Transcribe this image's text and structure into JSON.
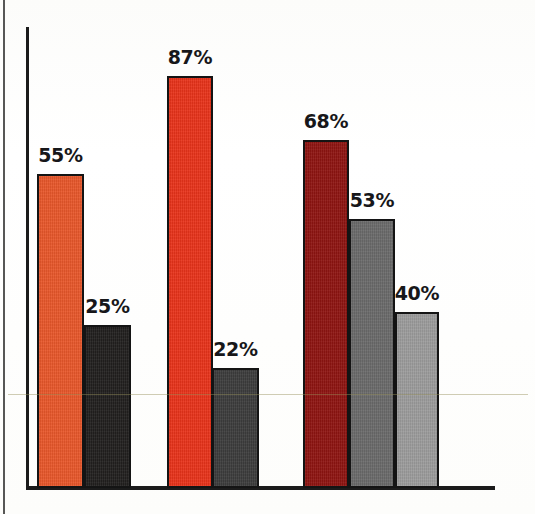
{
  "chart_data": {
    "type": "bar",
    "title": "",
    "subtitle": "",
    "xlabel": "",
    "ylabel": "",
    "ylim": [
      0,
      100
    ],
    "grid": false,
    "legend": "none",
    "categories": [
      "Group 1",
      "Group 2",
      "Group 3"
    ],
    "bars": [
      {
        "label": "55%",
        "value": 55,
        "color": "#E8572A",
        "group": 1,
        "x": 37,
        "width": 47
      },
      {
        "label": "25%",
        "value": 25,
        "color": "#211F1E",
        "group": 1,
        "x": 84,
        "width": 47
      },
      {
        "label": "87%",
        "value": 87,
        "color": "#E8331A",
        "group": 2,
        "x": 167,
        "width": 46
      },
      {
        "label": "22%",
        "value": 22,
        "color": "#3C3C3C",
        "group": 2,
        "x": 212,
        "width": 47
      },
      {
        "label": "68%",
        "value": 68,
        "color": "#8E1411",
        "group": 3,
        "x": 303,
        "width": 46
      },
      {
        "label": "53%",
        "value": 53,
        "color": "#6A6A6A",
        "group": 3,
        "x": 349,
        "width": 46
      },
      {
        "label": "40%",
        "value": 40,
        "color": "#9C9C9C",
        "group": 3,
        "x": 395,
        "width": 44
      }
    ],
    "series": [
      {
        "name": "Series A (red)",
        "values": [
          55,
          87,
          68
        ]
      },
      {
        "name": "Series B (gray)",
        "values": [
          25,
          22,
          53
        ]
      },
      {
        "name": "Series C (light gray)",
        "values": [
          null,
          null,
          40
        ]
      }
    ],
    "axis": {
      "baseline_y": 486,
      "y_axis_x": 26,
      "y_axis_top": 27,
      "x_axis_right": 495,
      "axis_color": "#1b1b1b"
    }
  },
  "bar_geometry": [
    {
      "name": "bar-55",
      "left": 37,
      "top": 174,
      "width": 47,
      "height": 314
    },
    {
      "name": "bar-25",
      "left": 84,
      "top": 325,
      "width": 47,
      "height": 163
    },
    {
      "name": "bar-87",
      "left": 167,
      "top": 76,
      "width": 46,
      "height": 412
    },
    {
      "name": "bar-22",
      "left": 212,
      "top": 368,
      "width": 47,
      "height": 120
    },
    {
      "name": "bar-68",
      "left": 303,
      "top": 140,
      "width": 46,
      "height": 348
    },
    {
      "name": "bar-53",
      "left": 349,
      "top": 219,
      "width": 46,
      "height": 269
    },
    {
      "name": "bar-40",
      "left": 395,
      "top": 312,
      "width": 44,
      "height": 176
    }
  ],
  "label_geometry": [
    {
      "name": "label-55",
      "left": 34,
      "top": 144
    },
    {
      "name": "label-25",
      "left": 82,
      "top": 295
    },
    {
      "name": "label-87",
      "left": 164,
      "top": 46
    },
    {
      "name": "label-22",
      "left": 210,
      "top": 338
    },
    {
      "name": "label-68",
      "left": 300,
      "top": 110
    },
    {
      "name": "label-53",
      "left": 347,
      "top": 189
    },
    {
      "name": "label-40",
      "left": 392,
      "top": 282
    }
  ]
}
